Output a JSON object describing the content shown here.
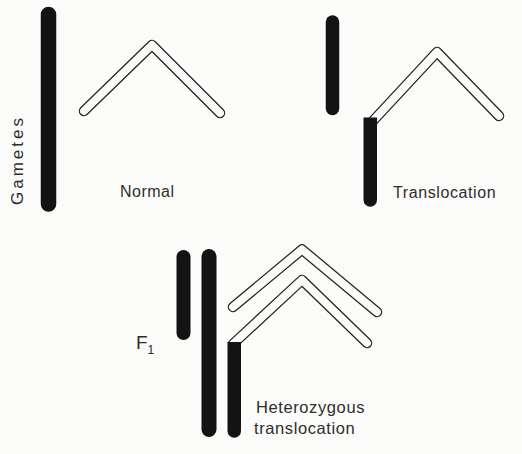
{
  "figure": {
    "background_color": "#fbfbf9",
    "ink_color": "#131313",
    "outline_color": "#232323",
    "text_color": "#2e2e2e",
    "row_label": "Gametes",
    "panels": {
      "normal": {
        "label": "Normal"
      },
      "translocation": {
        "label": "Translocation"
      },
      "f1": {
        "label_base": "F",
        "label_subscript": "1",
        "caption_line1": "Heterozygous",
        "caption_line2": "translocation"
      }
    }
  }
}
